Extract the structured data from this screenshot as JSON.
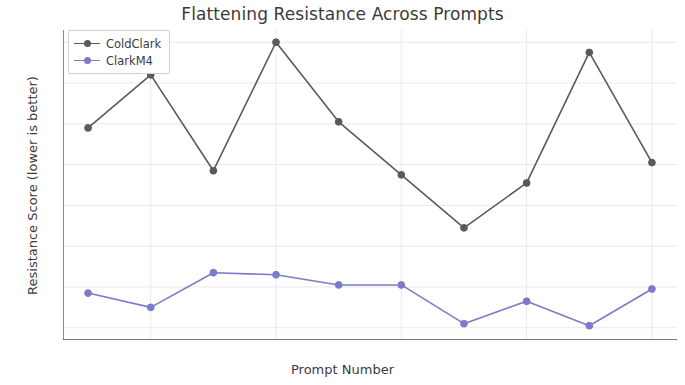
{
  "chart_data": {
    "type": "line",
    "title": "Flattening Resistance Across Prompts",
    "xlabel": "Prompt Number",
    "ylabel": "Resistance Score (lower is better)",
    "x": [
      1,
      2,
      3,
      4,
      5,
      6,
      7,
      8,
      9,
      10
    ],
    "xlim": [
      0.6,
      10.4
    ],
    "ylim": [
      -93,
      -17
    ],
    "xticks": [
      2,
      4,
      6,
      8,
      10
    ],
    "xticklabels": [
      "2",
      "4",
      "6",
      "8",
      "10"
    ],
    "yticks": [
      -20,
      -30,
      -40,
      -50,
      -60,
      -70,
      -80,
      -90
    ],
    "yticklabels": [
      "−20",
      "−30",
      "−40",
      "−50",
      "−60",
      "−70",
      "−80",
      "−90"
    ],
    "grid": true,
    "legend_position": "upper left",
    "series": [
      {
        "name": "ColdClark",
        "color": "#5a5a5a",
        "marker": "o",
        "values": [
          -41,
          -28,
          -51.5,
          -20,
          -39.5,
          -52.5,
          -65.5,
          -54.5,
          -22.5,
          -49.5
        ]
      },
      {
        "name": "ClarkM4",
        "color": "#7b7bc8",
        "marker": "o",
        "values": [
          -81.5,
          -85,
          -76.5,
          -77,
          -79.5,
          -79.5,
          -89,
          -83.5,
          -89.5,
          -80.5
        ]
      }
    ]
  },
  "legend": {
    "entries": [
      {
        "label": "ColdClark"
      },
      {
        "label": "ClarkM4"
      }
    ]
  },
  "colors": {
    "series_1": "#5a5a5a",
    "series_2": "#7b7bc8",
    "text": "#3b3b3b",
    "grid": "#e9e9ef",
    "axis": "#4a4a4a",
    "background": "#ffffff"
  }
}
